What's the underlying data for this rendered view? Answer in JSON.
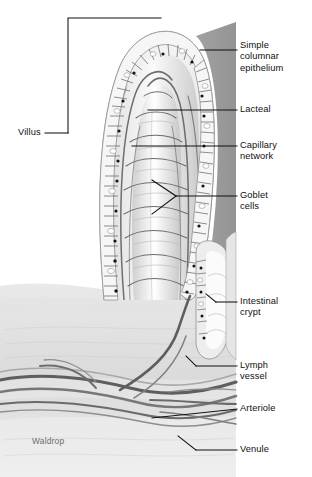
{
  "figure": {
    "signature": "Waldrop",
    "palette": {
      "background": "#ffffff",
      "ink": "#101010",
      "lumen_shadow": "#909090",
      "tissue_light": "#ededed",
      "tissue_mid": "#d8d8d8",
      "tissue_dark": "#b4b4b4",
      "vessel": "#5a5a5a",
      "nucleus": "#1a1a1a",
      "goblet": "#ffffff",
      "signature_color": "#6d6d6d"
    }
  },
  "labels": {
    "left": [
      {
        "id": "villus",
        "text": "Villus",
        "x": 18,
        "y": 133
      }
    ],
    "right": [
      {
        "id": "simple-columnar-epithelium",
        "text": "Simple\ncolumnar\nepithelium",
        "x": 240,
        "y": 40
      },
      {
        "id": "lacteal",
        "text": "Lacteal",
        "x": 240,
        "y": 105
      },
      {
        "id": "capillary-network",
        "text": "Capillary\nnetwork",
        "x": 240,
        "y": 140
      },
      {
        "id": "goblet-cells",
        "text": "Goblet\ncells",
        "x": 240,
        "y": 191
      },
      {
        "id": "intestinal-crypt",
        "text": "Intestinal\ncrypt",
        "x": 240,
        "y": 297
      },
      {
        "id": "lymph-vessel",
        "text": "Lymph\nvessel",
        "x": 240,
        "y": 358
      },
      {
        "id": "arteriole",
        "text": "Arteriole",
        "x": 240,
        "y": 405
      },
      {
        "id": "venule",
        "text": "Venule",
        "x": 240,
        "y": 445
      }
    ]
  },
  "structures": [
    {
      "id": "villus-body",
      "name": "Villus",
      "description": "Finger-like projection of intestinal mucosa"
    },
    {
      "id": "epithelium",
      "name": "Simple columnar epithelium",
      "description": "Single layer of tall columnar cells lining the villus surface"
    },
    {
      "id": "lacteal",
      "name": "Lacteal",
      "description": "Central lymphatic capillary inside the villus core"
    },
    {
      "id": "capillary-network",
      "name": "Capillary network",
      "description": "Blood capillary plexus surrounding the lacteal"
    },
    {
      "id": "goblet-cells",
      "name": "Goblet cells",
      "description": "Mucus-secreting cells interspersed in the epithelium"
    },
    {
      "id": "intestinal-crypt",
      "name": "Intestinal crypt",
      "description": "Crypt of Lieberkuhn at the base between villi"
    },
    {
      "id": "lymph-vessel",
      "name": "Lymph vessel",
      "description": "Submucosal lymphatic draining the lacteal"
    },
    {
      "id": "arteriole",
      "name": "Arteriole",
      "description": "Small artery supplying the villus capillaries"
    },
    {
      "id": "venule",
      "name": "Venule",
      "description": "Small vein draining the villus capillaries"
    }
  ]
}
